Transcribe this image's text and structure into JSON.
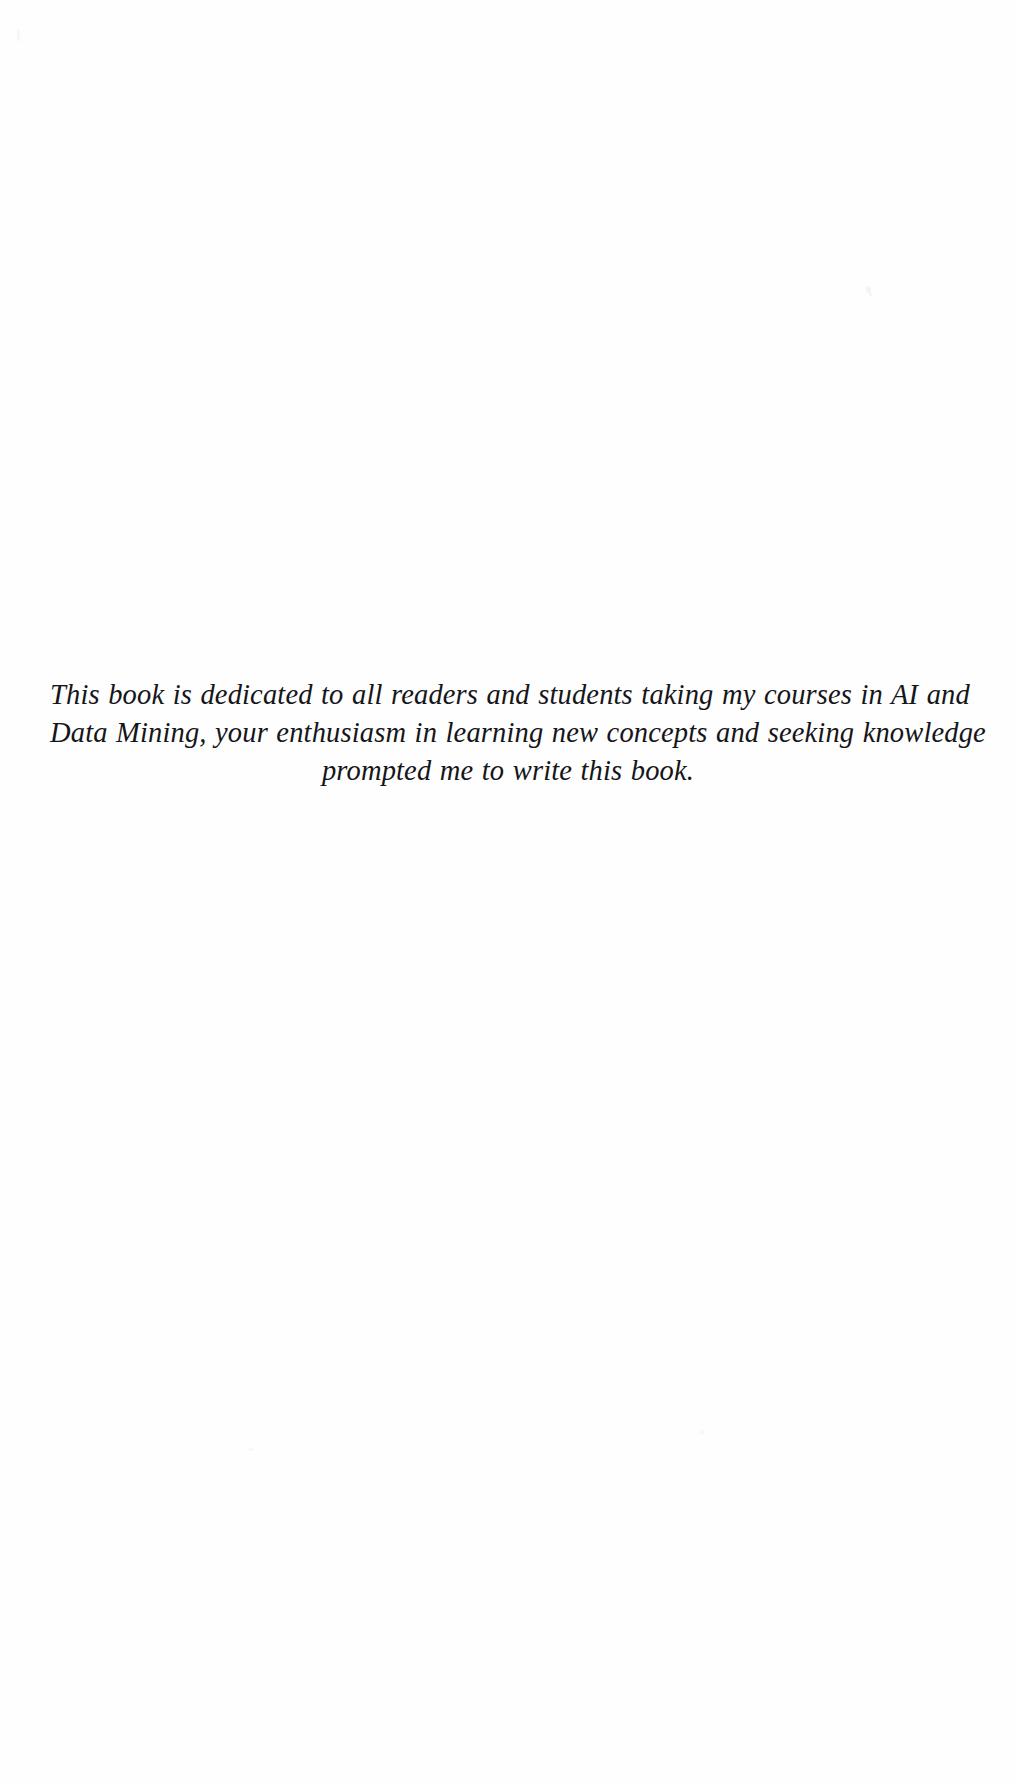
{
  "page": {
    "kind": "book-dedication-page",
    "background_color": "#fefefe",
    "text_color": "#16161a"
  },
  "dedication": {
    "lines": [
      "This book is dedicated to all readers and students taking my courses in AI and",
      "Data Mining, your enthusiasm in learning new concepts and seeking knowledge",
      "prompted me to write this book."
    ],
    "full_text": "This book is dedicated to all readers and students taking my courses in AI and Data Mining, your enthusiasm in learning new concepts and seeking knowledge prompted me to write this book."
  }
}
